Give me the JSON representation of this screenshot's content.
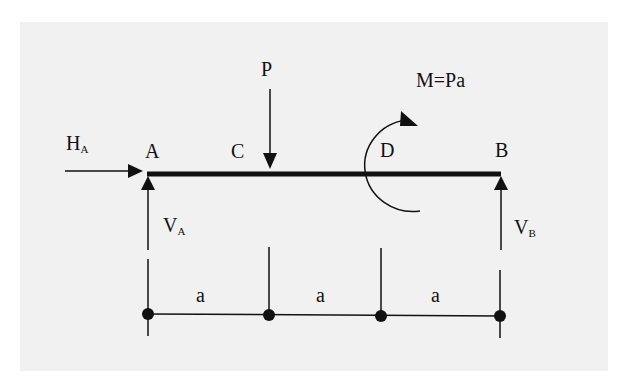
{
  "diagram": {
    "type": "simply supported beam free-body diagram",
    "colors": {
      "background": "#f1f1f1",
      "ink": "#111111"
    },
    "points": [
      {
        "id": "A",
        "label": "A"
      },
      {
        "id": "C",
        "label": "C"
      },
      {
        "id": "D",
        "label": "D"
      },
      {
        "id": "B",
        "label": "B"
      }
    ],
    "loads": {
      "point_load": {
        "label": "P",
        "at": "C",
        "direction": "down"
      },
      "moment": {
        "label": "M=Pa",
        "at": "D",
        "direction": "clockwise"
      }
    },
    "reactions": {
      "HA": {
        "main": "H",
        "sub": "A",
        "direction": "right"
      },
      "VA": {
        "main": "V",
        "sub": "A",
        "direction": "up"
      },
      "VB": {
        "main": "V",
        "sub": "B",
        "direction": "up"
      }
    },
    "dimensions": [
      {
        "from": "A",
        "to": "C",
        "label": "a"
      },
      {
        "from": "C",
        "to": "D",
        "label": "a"
      },
      {
        "from": "D",
        "to": "B",
        "label": "a"
      }
    ]
  }
}
